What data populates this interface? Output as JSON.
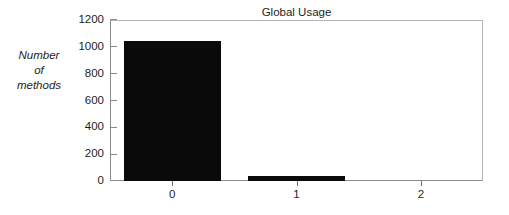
{
  "figure": {
    "title": "Global Usage",
    "y_axis_title_lines": [
      "Number",
      "of",
      "methods"
    ],
    "background_color": "#ffffff",
    "bar_color": "#0a0a0a",
    "axis_color": "#8a8a8a",
    "text_color": "#1d1d1d"
  },
  "chart_data": {
    "type": "bar",
    "title": "Global Usage",
    "xlabel": "",
    "ylabel": "Number of methods",
    "categories": [
      "0",
      "1",
      "2"
    ],
    "values": [
      1040,
      37,
      0
    ],
    "ylim": [
      0,
      1200
    ],
    "yticks": [
      0,
      200,
      400,
      600,
      800,
      1000,
      1200
    ],
    "ytick_labels": [
      "0",
      "200",
      "400",
      "600",
      "800",
      "1000",
      "1200"
    ],
    "xtick_labels": [
      "0",
      "1",
      "2"
    ],
    "grid": false,
    "legend": null,
    "series": [
      {
        "name": "Number of methods",
        "values": [
          1040,
          37,
          0
        ]
      }
    ]
  }
}
